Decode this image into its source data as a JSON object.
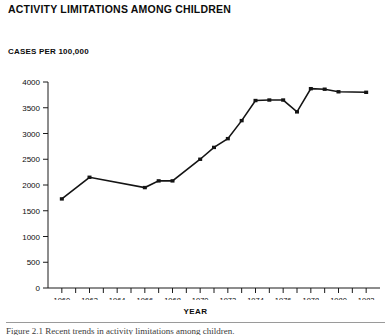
{
  "chart_data": {
    "type": "line",
    "title": "ACTIVITY LIMITATIONS AMONG CHILDREN",
    "subtitle": "",
    "ylabel": "CASES PER 100,000",
    "xlabel": "YEAR",
    "ylim": [
      0,
      4000
    ],
    "xlim": [
      1959,
      1983
    ],
    "ytick_labels": [
      "0",
      "500",
      "1000",
      "1500",
      "2000",
      "2500",
      "3000",
      "3500",
      "4000"
    ],
    "ytick_values": [
      0,
      500,
      1000,
      1500,
      2000,
      2500,
      3000,
      3500,
      4000
    ],
    "xtick_labels": [
      "1960",
      "1962",
      "1964",
      "1966",
      "1968",
      "1970",
      "1972",
      "1974",
      "1976",
      "1978",
      "1980",
      "1982"
    ],
    "xtick_values": [
      1960,
      1962,
      1964,
      1966,
      1968,
      1970,
      1972,
      1974,
      1976,
      1978,
      1980,
      1982
    ],
    "minor_xticks": [
      1960,
      1961,
      1962,
      1963,
      1964,
      1965,
      1966,
      1967,
      1968,
      1969,
      1970,
      1971,
      1972,
      1973,
      1974,
      1975,
      1976,
      1977,
      1978,
      1979,
      1980,
      1981,
      1982
    ],
    "grid": false,
    "legend": false,
    "markers": true,
    "line_color": "#141414",
    "x": [
      1960,
      1962,
      1966,
      1967,
      1968,
      1970,
      1971,
      1972,
      1973,
      1974,
      1975,
      1976,
      1977,
      1978,
      1979,
      1980,
      1982
    ],
    "values": [
      1730,
      2150,
      1950,
      2080,
      2080,
      2500,
      2730,
      2900,
      3250,
      3640,
      3650,
      3650,
      3420,
      3870,
      3860,
      3810,
      3800
    ],
    "series": [
      {
        "name": "Cases per 100,000",
        "points": [
          {
            "year": 1960,
            "value": 1730
          },
          {
            "year": 1962,
            "value": 2150
          },
          {
            "year": 1966,
            "value": 1950
          },
          {
            "year": 1967,
            "value": 2080
          },
          {
            "year": 1968,
            "value": 2080
          },
          {
            "year": 1970,
            "value": 2500
          },
          {
            "year": 1971,
            "value": 2730
          },
          {
            "year": 1972,
            "value": 2900
          },
          {
            "year": 1973,
            "value": 3250
          },
          {
            "year": 1974,
            "value": 3640
          },
          {
            "year": 1975,
            "value": 3650
          },
          {
            "year": 1976,
            "value": 3650
          },
          {
            "year": 1977,
            "value": 3420
          },
          {
            "year": 1978,
            "value": 3870
          },
          {
            "year": 1979,
            "value": 3860
          },
          {
            "year": 1980,
            "value": 3810
          },
          {
            "year": 1982,
            "value": 3800
          }
        ]
      }
    ]
  },
  "caption": {
    "text": "Figure 2.1  Recent trends in activity limitations among children."
  }
}
